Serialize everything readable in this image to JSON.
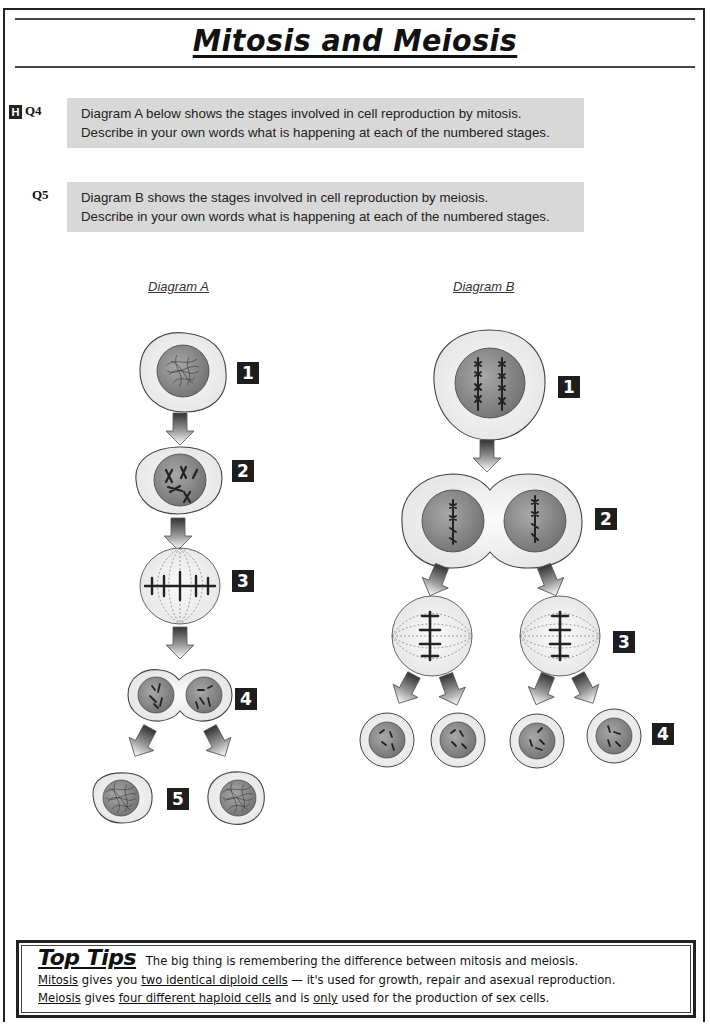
{
  "page": {
    "title": "Mitosis and Meiosis"
  },
  "questions": [
    {
      "badge": "H",
      "number": "Q4",
      "lines": [
        "Diagram A below shows the stages involved in cell reproduction by mitosis.",
        "Describe in your own words what is happening at each of the numbered stages."
      ]
    },
    {
      "badge": "",
      "number": "Q5",
      "lines": [
        "Diagram B shows the stages involved in cell reproduction by meiosis.",
        "Describe in your own words what is happening at each of the numbered stages."
      ]
    }
  ],
  "diagram_a": {
    "label": "Diagram A",
    "stages": [
      "1",
      "2",
      "3",
      "4",
      "5"
    ]
  },
  "diagram_b": {
    "label": "Diagram B",
    "stages": [
      "1",
      "2",
      "3",
      "4"
    ]
  },
  "top_tips": {
    "title": "Top Tips",
    "line1": "The big thing is remembering the difference between mitosis and meiosis.",
    "line2": {
      "term": "Mitosis",
      "mid1": " gives you ",
      "highlight": "two identical diploid cells",
      "rest": " — it's used for growth, repair and asexual reproduction."
    },
    "line3": {
      "term": "Meiosis",
      "mid1": " gives ",
      "highlight": "four different haploid cells",
      "mid2": " and is ",
      "emph": "only",
      "rest": " used for the production of sex cells."
    }
  },
  "colors": {
    "border": "#222222",
    "question_bg": "#d8d8d8",
    "number_box": "#1e1e1e",
    "nucleus": "#8a8a8a",
    "cytoplasm": "#f0f0f0"
  }
}
